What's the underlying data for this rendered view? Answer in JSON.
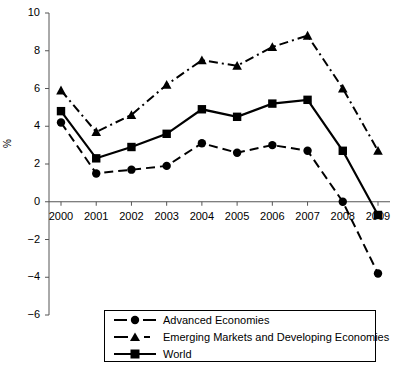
{
  "chart_data": {
    "type": "line",
    "title": "",
    "subtitle": "",
    "xlabel": "",
    "ylabel": "%",
    "categories": [
      "2000",
      "2001",
      "2002",
      "2003",
      "2004",
      "2005",
      "2006",
      "2007",
      "2008",
      "2009"
    ],
    "xlim": [
      2000,
      2009
    ],
    "ylim": [
      -6,
      10
    ],
    "yticks": [
      10,
      8,
      6,
      4,
      2,
      0,
      -2,
      -4,
      -6
    ],
    "ytick_labels": [
      "10",
      "8",
      "6",
      "4",
      "2",
      "0",
      "−2",
      "−4",
      "−6"
    ],
    "grid": false,
    "legend_position": "bottom",
    "series": [
      {
        "name": "Advanced Economies",
        "marker": "circle",
        "line_style": "dashed",
        "color": "#000000",
        "values": [
          4.2,
          1.5,
          1.7,
          1.9,
          3.1,
          2.6,
          3.0,
          2.7,
          0.0,
          -3.8
        ]
      },
      {
        "name": "Emerging Markets and Developing Economies",
        "marker": "triangle",
        "line_style": "dash-dot",
        "color": "#000000",
        "values": [
          5.9,
          3.7,
          4.6,
          6.2,
          7.5,
          7.2,
          8.2,
          8.8,
          6.0,
          2.7
        ]
      },
      {
        "name": "World",
        "marker": "square",
        "line_style": "solid",
        "color": "#000000",
        "values": [
          4.8,
          2.3,
          2.9,
          3.6,
          4.9,
          4.5,
          5.2,
          5.4,
          2.7,
          -0.7
        ]
      }
    ]
  },
  "axes": {
    "y_axis_title": "%"
  },
  "legend": {
    "entries": [
      {
        "label": "Advanced Economies"
      },
      {
        "label": "Emerging Markets and Developing Economies"
      },
      {
        "label": "World"
      }
    ]
  }
}
